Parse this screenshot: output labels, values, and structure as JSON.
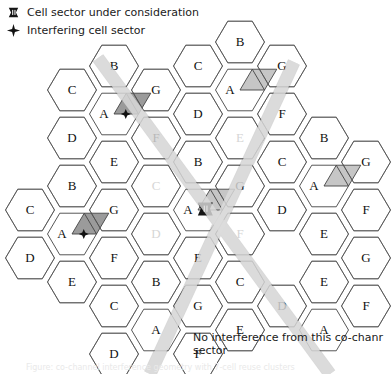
{
  "legend": {
    "items": [
      {
        "icon": "cell-sector-tower-icon",
        "label": "Cell sector under consideration"
      },
      {
        "icon": "four-point-star-icon",
        "label": "Interfering cell sector"
      }
    ]
  },
  "caption": {
    "line1": "No interference from this co-chanr",
    "line2": "sector"
  },
  "footnote": {
    "text": "Figure: co-channel interference geometry with 7-cell reuse clusters"
  },
  "colors": {
    "hex_stroke": "#444444",
    "cluster_stroke": "#555555",
    "shaded_sector": "#c6c6c6",
    "shaded_sector_dark": "#9b9b9b",
    "band": "#d9d9d9",
    "faded_label": "#d6d6d6",
    "text": "#1a1a1a",
    "background": "#ffffff"
  },
  "grid": {
    "hex_radius": 24.5,
    "reuse_pattern": [
      "A",
      "B",
      "C",
      "D",
      "E",
      "F",
      "G"
    ],
    "cells": [
      {
        "id": "c-0",
        "label": "B",
        "cx": 114,
        "cy": 66,
        "faded": false
      },
      {
        "id": "c-1",
        "label": "C",
        "cx": 72,
        "cy": 90,
        "faded": false
      },
      {
        "id": "c-2",
        "label": "G",
        "cx": 156,
        "cy": 90,
        "faded": false
      },
      {
        "id": "c-3",
        "label": "A",
        "cx": 114,
        "cy": 114,
        "faded": false,
        "sector": "right-diamond",
        "marker": "star"
      },
      {
        "id": "c-4",
        "label": "D",
        "cx": 72,
        "cy": 138,
        "faded": false
      },
      {
        "id": "c-5",
        "label": "F",
        "cx": 156,
        "cy": 138,
        "faded": false
      },
      {
        "id": "c-6",
        "label": "E",
        "cx": 114,
        "cy": 162,
        "faded": false
      },
      {
        "id": "c-7",
        "label": "B",
        "cx": 240,
        "cy": 42,
        "faded": false
      },
      {
        "id": "c-8",
        "label": "C",
        "cx": 198,
        "cy": 66,
        "faded": false
      },
      {
        "id": "c-9",
        "label": "G",
        "cx": 282,
        "cy": 66,
        "faded": false
      },
      {
        "id": "c-10",
        "label": "A",
        "cx": 240,
        "cy": 90,
        "faded": false,
        "sector": "right-diamond"
      },
      {
        "id": "c-11",
        "label": "D",
        "cx": 198,
        "cy": 114,
        "faded": false
      },
      {
        "id": "c-12",
        "label": "F",
        "cx": 282,
        "cy": 114,
        "faded": false
      },
      {
        "id": "c-13",
        "label": "E",
        "cx": 240,
        "cy": 138,
        "faded": true
      },
      {
        "id": "c-14",
        "label": "B",
        "cx": 198,
        "cy": 162,
        "faded": false
      },
      {
        "id": "c-15",
        "label": "C",
        "cx": 156,
        "cy": 186,
        "faded": true
      },
      {
        "id": "c-16",
        "label": "G",
        "cx": 240,
        "cy": 186,
        "faded": false
      },
      {
        "id": "c-17",
        "label": "A",
        "cx": 198,
        "cy": 210,
        "faded": false,
        "sector": "center-diamond",
        "marker": "tower"
      },
      {
        "id": "c-18",
        "label": "D",
        "cx": 156,
        "cy": 234,
        "faded": true
      },
      {
        "id": "c-19",
        "label": "F",
        "cx": 240,
        "cy": 234,
        "faded": true
      },
      {
        "id": "c-20",
        "label": "E",
        "cx": 198,
        "cy": 258,
        "faded": false
      },
      {
        "id": "c-21",
        "label": "B",
        "cx": 72,
        "cy": 186,
        "faded": false
      },
      {
        "id": "c-22",
        "label": "C",
        "cx": 30,
        "cy": 210,
        "faded": false
      },
      {
        "id": "c-23",
        "label": "G",
        "cx": 114,
        "cy": 210,
        "faded": false
      },
      {
        "id": "c-24",
        "label": "A",
        "cx": 72,
        "cy": 234,
        "faded": false,
        "sector": "right-diamond",
        "marker": "star"
      },
      {
        "id": "c-25",
        "label": "D",
        "cx": 30,
        "cy": 258,
        "faded": false
      },
      {
        "id": "c-26",
        "label": "F",
        "cx": 114,
        "cy": 258,
        "faded": false
      },
      {
        "id": "c-27",
        "label": "E",
        "cx": 72,
        "cy": 282,
        "faded": false
      },
      {
        "id": "c-28",
        "label": "B",
        "cx": 324,
        "cy": 138,
        "faded": false
      },
      {
        "id": "c-29",
        "label": "C",
        "cx": 282,
        "cy": 162,
        "faded": false
      },
      {
        "id": "c-30",
        "label": "G",
        "cx": 366,
        "cy": 162,
        "faded": false
      },
      {
        "id": "c-31",
        "label": "A",
        "cx": 324,
        "cy": 186,
        "faded": false,
        "sector": "right-diamond"
      },
      {
        "id": "c-32",
        "label": "D",
        "cx": 282,
        "cy": 210,
        "faded": false
      },
      {
        "id": "c-33",
        "label": "F",
        "cx": 366,
        "cy": 210,
        "faded": false
      },
      {
        "id": "c-34",
        "label": "E",
        "cx": 324,
        "cy": 234,
        "faded": false
      },
      {
        "id": "c-35",
        "label": "B",
        "cx": 156,
        "cy": 282,
        "faded": false
      },
      {
        "id": "c-36",
        "label": "C",
        "cx": 114,
        "cy": 306,
        "faded": false
      },
      {
        "id": "c-37",
        "label": "G",
        "cx": 198,
        "cy": 306,
        "faded": false
      },
      {
        "id": "c-38",
        "label": "A",
        "cx": 156,
        "cy": 330,
        "faded": false
      },
      {
        "id": "c-39",
        "label": "D",
        "cx": 114,
        "cy": 354,
        "faded": false
      },
      {
        "id": "c-40",
        "label": "F",
        "cx": 198,
        "cy": 354,
        "faded": false
      },
      {
        "id": "c-41",
        "label": "C",
        "cx": 240,
        "cy": 282,
        "faded": false
      },
      {
        "id": "c-42",
        "label": "D",
        "cx": 282,
        "cy": 306,
        "faded": false
      },
      {
        "id": "c-43",
        "label": "E",
        "cx": 324,
        "cy": 282,
        "faded": false
      },
      {
        "id": "c-44",
        "label": "G",
        "cx": 366,
        "cy": 258,
        "faded": false
      },
      {
        "id": "c-45",
        "label": "F",
        "cx": 366,
        "cy": 306,
        "faded": false
      },
      {
        "id": "c-46",
        "label": "A",
        "cx": 324,
        "cy": 330,
        "faded": false
      },
      {
        "id": "c-47",
        "label": "E",
        "cx": 240,
        "cy": 330,
        "faded": false
      }
    ],
    "interference_bands": [
      {
        "id": "band-a",
        "x1": 294,
        "y1": 62,
        "x2": 150,
        "y2": 374
      },
      {
        "id": "band-b",
        "x1": 98,
        "y1": 58,
        "x2": 330,
        "y2": 374
      }
    ]
  }
}
